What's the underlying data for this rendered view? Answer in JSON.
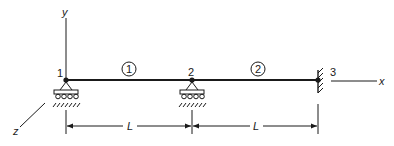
{
  "diagram": {
    "type": "beam-finite-element-model",
    "axes": {
      "x_label": "x",
      "y_label": "y",
      "z_label": "z"
    },
    "nodes": [
      {
        "id": "1",
        "label": "1",
        "support": "roller"
      },
      {
        "id": "2",
        "label": "2",
        "support": "roller"
      },
      {
        "id": "3",
        "label": "3",
        "support": "fixed"
      }
    ],
    "elements": [
      {
        "id": "1",
        "label": "1",
        "from": "1",
        "to": "2"
      },
      {
        "id": "2",
        "label": "2",
        "from": "2",
        "to": "3"
      }
    ],
    "dimensions": [
      {
        "label": "L",
        "from": "1",
        "to": "2"
      },
      {
        "label": "L",
        "from": "2",
        "to": "3"
      }
    ],
    "colors": {
      "line": "#1a1a1a",
      "background": "#ffffff"
    }
  }
}
